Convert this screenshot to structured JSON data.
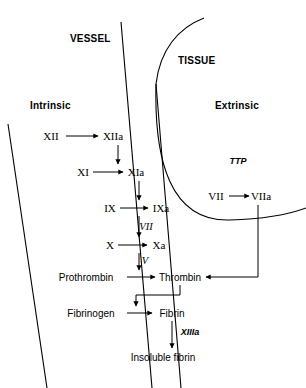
{
  "figure": {
    "background_color": "#ffffff",
    "line_color": "#000000"
  },
  "regions": [
    {
      "id": "vessel",
      "label": "VESSEL",
      "x": 70,
      "y": 38
    },
    {
      "id": "tissue",
      "label": "TISSUE",
      "x": 178,
      "y": 60
    },
    {
      "id": "intrinsic",
      "label": "Intrinsic",
      "x": 30,
      "y": 105
    },
    {
      "id": "extrinsic",
      "label": "Extrinsic",
      "x": 215,
      "y": 105
    }
  ],
  "nodes": [
    {
      "id": "xii",
      "label": "XII",
      "x": 51,
      "y": 136,
      "anchor": "center",
      "font": "serif"
    },
    {
      "id": "xiia",
      "label": "XIIa",
      "x": 113,
      "y": 136,
      "anchor": "center",
      "font": "serif"
    },
    {
      "id": "xi",
      "label": "XI",
      "x": 83,
      "y": 172,
      "anchor": "center",
      "font": "serif"
    },
    {
      "id": "xia",
      "label": "XIa",
      "x": 136,
      "y": 172,
      "anchor": "center",
      "font": "serif"
    },
    {
      "id": "ix",
      "label": "IX",
      "x": 110,
      "y": 208,
      "anchor": "center",
      "font": "serif"
    },
    {
      "id": "ixa",
      "label": "IXa",
      "x": 161,
      "y": 208,
      "anchor": "center",
      "font": "serif"
    },
    {
      "id": "x",
      "label": "X",
      "x": 110,
      "y": 245,
      "anchor": "center",
      "font": "serif"
    },
    {
      "id": "xa",
      "label": "Xa",
      "x": 159,
      "y": 245,
      "anchor": "center",
      "font": "serif"
    },
    {
      "id": "prothrombin",
      "label": "Prothrombin",
      "x": 86,
      "y": 277,
      "anchor": "center",
      "font": "sans"
    },
    {
      "id": "thrombin",
      "label": "Thrombin",
      "x": 180,
      "y": 277,
      "anchor": "center",
      "font": "sans"
    },
    {
      "id": "fibrinogen",
      "label": "Fibrinogen",
      "x": 91,
      "y": 313,
      "anchor": "center",
      "font": "sans"
    },
    {
      "id": "fibrin",
      "label": "Fibrin",
      "x": 172,
      "y": 313,
      "anchor": "center",
      "font": "sans"
    },
    {
      "id": "insoluble-fibrin",
      "label": "Insoluble fibrin",
      "x": 163,
      "y": 357,
      "anchor": "center",
      "font": "sans"
    },
    {
      "id": "vii-zymogen",
      "label": "VII",
      "x": 216,
      "y": 196,
      "anchor": "center",
      "font": "serif"
    },
    {
      "id": "viia",
      "label": "VIIa",
      "x": 261,
      "y": 196,
      "anchor": "center",
      "font": "serif"
    }
  ],
  "cofactors": [
    {
      "id": "cofactor-vii",
      "label": "VII",
      "x": 146,
      "y": 226,
      "font": "serif"
    },
    {
      "id": "cofactor-v",
      "label": "V",
      "x": 145,
      "y": 260,
      "font": "serif"
    },
    {
      "id": "cofactor-ttp",
      "label": "TTP",
      "x": 238,
      "y": 161,
      "font": "sans"
    },
    {
      "id": "cofactor-xiiia",
      "label": "XIIIa",
      "x": 190,
      "y": 332,
      "font": "sans"
    }
  ],
  "reactions": [
    {
      "id": "xii-to-xiia",
      "from": "XII",
      "to": "XIIa",
      "type": "horizontal-arrow"
    },
    {
      "id": "xiia-to-xia",
      "from": "XIIa",
      "to": "XIa",
      "type": "vertical-arrow"
    },
    {
      "id": "xi-to-xia",
      "from": "XI",
      "to": "XIa",
      "type": "horizontal-arrow"
    },
    {
      "id": "xia-to-ixa",
      "from": "XIa",
      "to": "IXa",
      "type": "vertical-arrow"
    },
    {
      "id": "ix-to-ixa",
      "from": "IX",
      "to": "IXa",
      "type": "horizontal-arrow"
    },
    {
      "id": "ixa-to-xa",
      "from": "IXa",
      "to": "Xa",
      "type": "vertical-arrow",
      "cofactor": "VII"
    },
    {
      "id": "x-to-xa",
      "from": "X",
      "to": "Xa",
      "type": "horizontal-arrow"
    },
    {
      "id": "xa-to-thrombin",
      "from": "Xa",
      "to": "Thrombin",
      "type": "vertical-arrow",
      "cofactor": "V"
    },
    {
      "id": "prothrombin-to-thrombin",
      "from": "Prothrombin",
      "to": "Thrombin",
      "type": "horizontal-arrow"
    },
    {
      "id": "thrombin-to-fibrin-reaction",
      "from": "Thrombin",
      "to": "Fibrinogen-Fibrin",
      "type": "feedback-loop"
    },
    {
      "id": "fibrinogen-to-fibrin",
      "from": "Fibrinogen",
      "to": "Fibrin",
      "type": "horizontal-arrow"
    },
    {
      "id": "fibrin-to-insoluble",
      "from": "Fibrin",
      "to": "Insoluble fibrin",
      "type": "vertical-arrow",
      "cofactor": "XIIIa"
    },
    {
      "id": "vii-to-viia",
      "from": "VII",
      "to": "VIIa",
      "type": "horizontal-arrow"
    },
    {
      "id": "viia-to-thrombin",
      "from": "VIIa",
      "to": "Thrombin",
      "type": "elbow-arrow"
    }
  ]
}
